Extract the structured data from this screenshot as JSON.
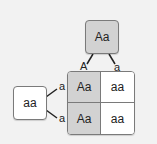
{
  "parent_top": {
    "genotype": "Aa",
    "alleles": [
      "A",
      "a"
    ]
  },
  "parent_left": {
    "genotype": "aa",
    "alleles": [
      "a",
      "a"
    ]
  },
  "punnett": {
    "rows": [
      [
        {
          "genotype": "Aa",
          "shade": "gray"
        },
        {
          "genotype": "aa",
          "shade": "white"
        }
      ],
      [
        {
          "genotype": "Aa",
          "shade": "gray"
        },
        {
          "genotype": "aa",
          "shade": "white"
        }
      ]
    ]
  },
  "colors": {
    "background": "#f2f2f2",
    "dominant_fill": "#d2d2d2",
    "recessive_fill": "#ffffff",
    "border": "#7a7a7a"
  }
}
